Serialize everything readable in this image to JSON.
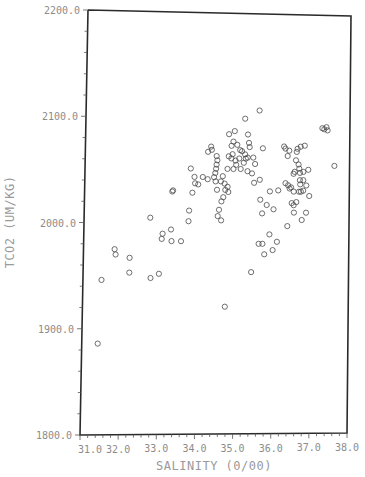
{
  "chart_data": {
    "type": "scatter",
    "title": "",
    "xlabel": "SALINITY (0/00)",
    "ylabel": "TCO2 (UM/KG)",
    "xlim": [
      31.0,
      38.0
    ],
    "ylim": [
      1800.0,
      2200.0
    ],
    "x_ticks": [
      "31.0",
      "32.0",
      "33.0",
      "34.0",
      "35.0",
      "36.0",
      "37.0",
      "38.0"
    ],
    "y_ticks": [
      "1800.0",
      "1900.0",
      "2000.0",
      "2100.0",
      "2200.0"
    ],
    "grid": false,
    "legend": null,
    "marker": "open-circle",
    "series": [
      {
        "name": "TCO2 vs Salinity",
        "points": [
          [
            31.42,
            1886
          ],
          [
            31.49,
            1946
          ],
          [
            31.82,
            1975
          ],
          [
            31.85,
            1970
          ],
          [
            32.22,
            1967
          ],
          [
            32.22,
            1953
          ],
          [
            32.78,
            1948
          ],
          [
            33.0,
            1952
          ],
          [
            32.75,
            2005
          ],
          [
            33.06,
            1985
          ],
          [
            33.08,
            1990
          ],
          [
            33.3,
            1994
          ],
          [
            33.32,
            1983
          ],
          [
            33.57,
            1983
          ],
          [
            33.32,
            2030
          ],
          [
            33.34,
            2031
          ],
          [
            33.76,
            2002
          ],
          [
            33.77,
            2012
          ],
          [
            33.8,
            2052
          ],
          [
            33.9,
            2044
          ],
          [
            33.92,
            2038
          ],
          [
            34.0,
            2037
          ],
          [
            33.85,
            2029
          ],
          [
            34.25,
            2068
          ],
          [
            34.33,
            2073
          ],
          [
            34.35,
            2070
          ],
          [
            34.48,
            2064
          ],
          [
            34.5,
            2060
          ],
          [
            34.48,
            2056
          ],
          [
            34.47,
            2052
          ],
          [
            34.45,
            2048
          ],
          [
            34.42,
            2044
          ],
          [
            34.12,
            2044
          ],
          [
            34.8,
            2085
          ],
          [
            34.87,
            2074
          ],
          [
            34.95,
            2088
          ],
          [
            34.92,
            2078
          ],
          [
            34.9,
            2066
          ],
          [
            35.02,
            2075
          ],
          [
            35.1,
            2070
          ],
          [
            35.22,
            2100
          ],
          [
            35.3,
            2085
          ],
          [
            35.33,
            2077
          ],
          [
            35.35,
            2073
          ],
          [
            35.15,
            2069
          ],
          [
            35.23,
            2066
          ],
          [
            35.25,
            2062
          ],
          [
            35.3,
            2063
          ],
          [
            34.8,
            2064
          ],
          [
            34.87,
            2062
          ],
          [
            34.98,
            2060
          ],
          [
            35.08,
            2062
          ],
          [
            35.2,
            2058
          ],
          [
            35.0,
            2056
          ],
          [
            34.93,
            2052
          ],
          [
            35.12,
            2052
          ],
          [
            35.3,
            2050
          ],
          [
            34.77,
            2052
          ],
          [
            34.65,
            2045
          ],
          [
            34.6,
            2040
          ],
          [
            34.7,
            2038
          ],
          [
            34.78,
            2035
          ],
          [
            34.72,
            2032
          ],
          [
            34.8,
            2030
          ],
          [
            34.67,
            2025
          ],
          [
            34.62,
            2021
          ],
          [
            34.5,
            2032
          ],
          [
            34.46,
            2040
          ],
          [
            34.25,
            2042
          ],
          [
            34.56,
            2013
          ],
          [
            34.53,
            2007
          ],
          [
            34.62,
            2003
          ],
          [
            35.48,
            2039
          ],
          [
            35.63,
            2042
          ],
          [
            35.9,
            2031
          ],
          [
            35.7,
            2010
          ],
          [
            35.82,
            2018
          ],
          [
            35.62,
            1981
          ],
          [
            35.72,
            1981
          ],
          [
            35.77,
            1971
          ],
          [
            35.43,
            1954
          ],
          [
            34.75,
            1921
          ],
          [
            35.6,
            2108
          ],
          [
            36.26,
            2074
          ],
          [
            36.3,
            2072
          ],
          [
            36.4,
            2070
          ],
          [
            36.36,
            2065
          ],
          [
            36.62,
            2072
          ],
          [
            36.7,
            2074
          ],
          [
            36.6,
            2069
          ],
          [
            36.81,
            2075
          ],
          [
            36.58,
            2061
          ],
          [
            36.65,
            2057
          ],
          [
            36.67,
            2053
          ],
          [
            36.69,
            2049
          ],
          [
            36.55,
            2050
          ],
          [
            36.69,
            2042
          ],
          [
            36.78,
            2050
          ],
          [
            36.52,
            2048
          ],
          [
            36.78,
            2042
          ],
          [
            36.91,
            2052
          ],
          [
            37.27,
            2092
          ],
          [
            37.38,
            2093
          ],
          [
            37.41,
            2090
          ],
          [
            37.32,
            2091
          ],
          [
            37.6,
            2056
          ],
          [
            36.31,
            2039
          ],
          [
            36.38,
            2037
          ],
          [
            36.46,
            2035
          ],
          [
            36.42,
            2034
          ],
          [
            36.7,
            2038
          ],
          [
            36.86,
            2037
          ],
          [
            36.78,
            2032
          ],
          [
            36.94,
            2027
          ],
          [
            36.12,
            2032
          ],
          [
            36.53,
            2031
          ],
          [
            36.67,
            2031
          ],
          [
            36.72,
            2031
          ],
          [
            36.48,
            2020
          ],
          [
            36.6,
            2021
          ],
          [
            36.53,
            2018
          ],
          [
            36.0,
            2014
          ],
          [
            36.54,
            2011
          ],
          [
            36.86,
            2011
          ],
          [
            36.75,
            2004
          ],
          [
            36.37,
            1998
          ],
          [
            35.65,
            2023
          ],
          [
            35.9,
            1990
          ],
          [
            35.99,
            1975
          ],
          [
            36.1,
            1983
          ],
          [
            35.5,
            2057
          ],
          [
            35.42,
            2048
          ],
          [
            35.45,
            2063
          ],
          [
            35.7,
            2072
          ]
        ]
      }
    ]
  },
  "plot": {
    "x_axis_title": "SALINITY (0/00)",
    "y_axis_title": "TCO2 (UM/KG)"
  }
}
